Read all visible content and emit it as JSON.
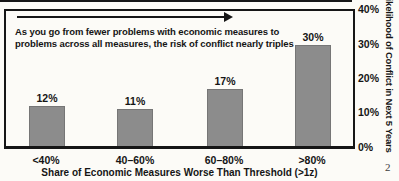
{
  "page": {
    "background": "#fcfbf7",
    "page_number": "2"
  },
  "chart_data": {
    "type": "bar",
    "categories": [
      "<40%",
      "40–60%",
      "60–80%",
      ">80%"
    ],
    "values": [
      12,
      11,
      17,
      30
    ],
    "value_labels": [
      "12%",
      "11%",
      "17%",
      "30%"
    ],
    "xlabel": "Share of Economic Measures Worse Than Threshold (>1z)",
    "ylabel": "Likelihood of Conflict in Next 5 Years",
    "ylim": [
      0,
      40
    ],
    "yticks": [
      "40%",
      "30%",
      "20%",
      "10%",
      "0%"
    ],
    "grid": "off",
    "legend": "none",
    "bar_color": "#8c8c8c",
    "annotation_lines": [
      "As you go from fewer problems with economic measures to",
      "problems across all measures, the risk of conflict nearly triples"
    ]
  }
}
